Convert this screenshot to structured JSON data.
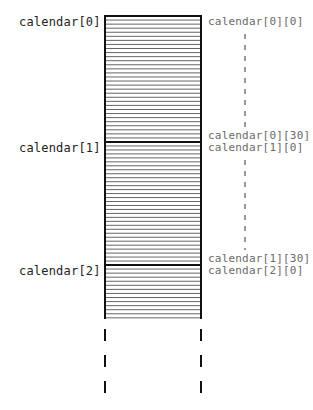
{
  "diagram": {
    "type": "memory-layout",
    "colors": {
      "outline": "#111111",
      "row_lines": "#555555",
      "left_label_text": "#222222",
      "right_label_text": "#6a6a6a",
      "dashed_connector": "#555555"
    },
    "row_labels": [
      {
        "text": "calendar[0]",
        "y": 22
      },
      {
        "text": "calendar[1]",
        "y": 148
      },
      {
        "text": "calendar[2]",
        "y": 271
      }
    ],
    "element_labels": [
      {
        "text": "calendar[0][0]",
        "y": 22
      },
      {
        "text": "calendar[0][30]",
        "y": 136
      },
      {
        "text": "calendar[1][0]",
        "y": 148
      },
      {
        "text": "calendar[1][30]",
        "y": 259
      },
      {
        "text": "calendar[2][0]",
        "y": 271
      }
    ],
    "elements_per_row": 31,
    "box": {
      "x": 105,
      "y_top": 16,
      "x_right": 201,
      "y_bottom": 319
    },
    "row_dividers_y": [
      142,
      265
    ],
    "continuation": "dashed lines below box indicate more rows"
  }
}
